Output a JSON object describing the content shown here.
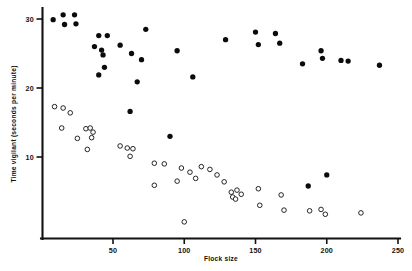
{
  "chart_data": {
    "type": "scatter",
    "title": "",
    "xlabel": "Flock size",
    "ylabel": "Time vigilant (seconds per minute)",
    "xlim": [
      0,
      250
    ],
    "ylim": [
      0,
      32
    ],
    "xticks": [
      50,
      100,
      150,
      200,
      250
    ],
    "yticks": [
      10,
      20,
      30
    ],
    "grid": false,
    "legend": "none",
    "series": [
      {
        "name": "filled-circles",
        "marker": "filled circle",
        "color": "#0b0b0b",
        "points": [
          [
            8,
            29.9
          ],
          [
            15,
            30.6
          ],
          [
            16,
            29.2
          ],
          [
            23,
            30.6
          ],
          [
            24,
            29.3
          ],
          [
            40,
            27.6
          ],
          [
            46,
            27.6
          ],
          [
            37,
            26.0
          ],
          [
            42,
            25.5
          ],
          [
            43,
            24.8
          ],
          [
            44,
            23.0
          ],
          [
            55,
            26.2
          ],
          [
            63,
            25.0
          ],
          [
            70,
            24.1
          ],
          [
            40,
            21.9
          ],
          [
            73,
            28.5
          ],
          [
            67,
            20.9
          ],
          [
            95,
            25.4
          ],
          [
            106,
            21.6
          ],
          [
            62,
            16.6
          ],
          [
            90,
            13.0
          ],
          [
            129,
            27.0
          ],
          [
            150,
            28.1
          ],
          [
            152,
            26.3
          ],
          [
            164,
            27.9
          ],
          [
            167,
            26.5
          ],
          [
            196,
            25.4
          ],
          [
            197,
            24.3
          ],
          [
            183,
            23.5
          ],
          [
            210,
            24.0
          ],
          [
            215,
            23.9
          ],
          [
            237,
            23.3
          ],
          [
            187,
            5.8
          ],
          [
            200,
            7.4
          ]
        ]
      },
      {
        "name": "open-circles",
        "marker": "open circle",
        "color": "#ffffff",
        "points": [
          [
            9,
            17.3
          ],
          [
            15,
            17.1
          ],
          [
            20,
            16.4
          ],
          [
            14,
            14.2
          ],
          [
            25,
            12.7
          ],
          [
            31,
            14.1
          ],
          [
            34,
            14.2
          ],
          [
            36,
            13.6
          ],
          [
            35,
            12.8
          ],
          [
            32,
            11.1
          ],
          [
            55,
            11.6
          ],
          [
            60,
            11.3
          ],
          [
            64,
            11.2
          ],
          [
            62,
            10.1
          ],
          [
            79,
            9.1
          ],
          [
            86,
            9.0
          ],
          [
            98,
            8.4
          ],
          [
            79,
            5.9
          ],
          [
            95,
            6.5
          ],
          [
            104,
            7.8
          ],
          [
            100,
            0.6
          ],
          [
            112,
            8.6
          ],
          [
            108,
            6.9
          ],
          [
            118,
            8.2
          ],
          [
            123,
            7.4
          ],
          [
            128,
            6.4
          ],
          [
            133,
            4.9
          ],
          [
            134,
            4.2
          ],
          [
            136,
            3.9
          ],
          [
            137,
            5.2
          ],
          [
            140,
            4.6
          ],
          [
            152,
            5.4
          ],
          [
            153,
            3.0
          ],
          [
            168,
            4.5
          ],
          [
            170,
            2.3
          ],
          [
            188,
            2.2
          ],
          [
            196,
            2.4
          ],
          [
            199,
            1.7
          ],
          [
            224,
            1.9
          ]
        ]
      }
    ]
  },
  "axes": {
    "y_tick_labels": [
      "30",
      "20",
      "10"
    ],
    "x_tick_labels": [
      "50",
      "100",
      "150",
      "200",
      "250"
    ]
  }
}
